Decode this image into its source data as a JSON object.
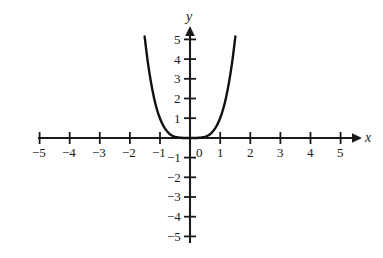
{
  "chart_data": {
    "type": "line",
    "title": "",
    "xlabel": "x",
    "ylabel": "y",
    "xlim": [
      -5.6,
      5.6
    ],
    "ylim": [
      -5.6,
      5.6
    ],
    "grid": false,
    "legend": null,
    "x_ticks": [
      -5,
      -4,
      -3,
      -2,
      -1,
      1,
      2,
      3,
      4,
      5
    ],
    "y_ticks": [
      5,
      4,
      3,
      2,
      1,
      -1,
      -2,
      -3,
      -4,
      -5
    ],
    "x_tick_labels": [
      "−5",
      "−4",
      "−3",
      "−2",
      "−1",
      "1",
      "2",
      "3",
      "4",
      "5"
    ],
    "y_tick_labels": [
      "5",
      "4",
      "3",
      "2",
      "1",
      "−1",
      "−2",
      "−3",
      "−4",
      "−5"
    ],
    "origin_label": "0",
    "series": [
      {
        "name": "curve",
        "equation": "y = x^4",
        "color": "#111111",
        "x": [
          -1.58,
          -1.5,
          -1.4,
          -1.3,
          -1.2,
          -1.1,
          -1.0,
          -0.9,
          -0.8,
          -0.7,
          -0.6,
          -0.5,
          -0.4,
          -0.3,
          -0.2,
          -0.1,
          0.0,
          0.1,
          0.2,
          0.3,
          0.4,
          0.5,
          0.6,
          0.7,
          0.8,
          0.9,
          1.0,
          1.1,
          1.2,
          1.3,
          1.4,
          1.5,
          1.58
        ],
        "y": [
          6.23,
          5.06,
          3.84,
          2.86,
          2.07,
          1.46,
          1.0,
          0.66,
          0.41,
          0.24,
          0.13,
          0.06,
          0.03,
          0.01,
          0.0,
          0.0,
          0.0,
          0.0,
          0.0,
          0.01,
          0.03,
          0.06,
          0.13,
          0.24,
          0.41,
          0.66,
          1.0,
          1.46,
          2.07,
          2.86,
          3.84,
          5.06,
          6.23
        ]
      }
    ]
  },
  "labels": {
    "x_axis_name": "x",
    "y_axis_name": "y",
    "origin": "0",
    "x": {
      "n5": "−5",
      "n4": "−4",
      "n3": "−3",
      "n2": "−2",
      "n1": "−1",
      "p1": "1",
      "p2": "2",
      "p3": "3",
      "p4": "4",
      "p5": "5"
    },
    "y": {
      "p5": "5",
      "p4": "4",
      "p3": "3",
      "p2": "2",
      "p1": "1",
      "n1": "−1",
      "n2": "−2",
      "n3": "−3",
      "n4": "−4",
      "n5": "−5"
    }
  },
  "colors": {
    "background": "#ffffff",
    "axis": "#1a1a1a",
    "curve": "#111111",
    "text": "#1a1a1a"
  }
}
